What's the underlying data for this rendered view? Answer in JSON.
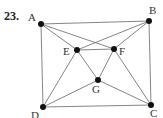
{
  "problem": {
    "number": "23.",
    "number_pos": [
      4,
      20
    ]
  },
  "graph": {
    "vertices": [
      {
        "id": "A",
        "x": 41,
        "y": 24,
        "lx": 28,
        "ly": 21
      },
      {
        "id": "B",
        "x": 149,
        "y": 21,
        "lx": 149,
        "ly": 14
      },
      {
        "id": "C",
        "x": 151,
        "y": 105,
        "lx": 150,
        "ly": 117
      },
      {
        "id": "D",
        "x": 43,
        "y": 107,
        "lx": 31,
        "ly": 119
      },
      {
        "id": "E",
        "x": 77,
        "y": 50,
        "lx": 63,
        "ly": 55
      },
      {
        "id": "F",
        "x": 114,
        "y": 49,
        "lx": 119,
        "ly": 55
      },
      {
        "id": "G",
        "x": 98,
        "y": 80,
        "lx": 92,
        "ly": 93
      }
    ],
    "edges": [
      [
        "A",
        "B"
      ],
      [
        "A",
        "D"
      ],
      [
        "B",
        "C"
      ],
      [
        "D",
        "C"
      ],
      [
        "A",
        "E"
      ],
      [
        "A",
        "F"
      ],
      [
        "B",
        "E"
      ],
      [
        "B",
        "F"
      ],
      [
        "E",
        "F"
      ],
      [
        "E",
        "G"
      ],
      [
        "F",
        "G"
      ],
      [
        "E",
        "D"
      ],
      [
        "F",
        "C"
      ],
      [
        "D",
        "G"
      ],
      [
        "G",
        "C"
      ]
    ]
  }
}
